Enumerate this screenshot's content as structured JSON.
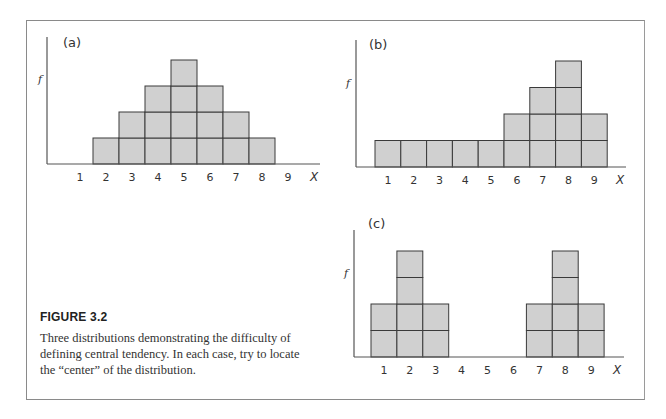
{
  "figure": {
    "title": "FIGURE 3.2",
    "caption": "Three distributions demonstrating the difficulty of defining central tendency. In each case, try to locate the “center” of the distribution."
  },
  "colors": {
    "bar_fill": "#d0d0d0",
    "bar_stroke": "#3a3a3a",
    "axis": "#555555",
    "frame": "#8a8a8a"
  },
  "chart_data": [
    {
      "type": "bar",
      "panel": "(a)",
      "title": "(a)",
      "xlabel": "X",
      "ylabel": "f",
      "categories": [
        "1",
        "2",
        "3",
        "4",
        "5",
        "6",
        "7",
        "8",
        "9"
      ],
      "values": [
        0,
        1,
        2,
        3,
        4,
        3,
        2,
        1,
        0
      ],
      "ylim": [
        0,
        4
      ],
      "grid": false,
      "legend": null,
      "style": "stacked unit blocks (histogram)"
    },
    {
      "type": "bar",
      "panel": "(b)",
      "title": "(b)",
      "xlabel": "X",
      "ylabel": "f",
      "categories": [
        "1",
        "2",
        "3",
        "4",
        "5",
        "6",
        "7",
        "8",
        "9"
      ],
      "values": [
        1,
        1,
        1,
        1,
        1,
        2,
        3,
        4,
        2
      ],
      "ylim": [
        0,
        4
      ],
      "grid": false,
      "legend": null,
      "style": "stacked unit blocks (histogram)"
    },
    {
      "type": "bar",
      "panel": "(c)",
      "title": "(c)",
      "xlabel": "X",
      "ylabel": "f",
      "categories": [
        "1",
        "2",
        "3",
        "4",
        "5",
        "6",
        "7",
        "8",
        "9"
      ],
      "values": [
        2,
        4,
        2,
        0,
        0,
        0,
        2,
        4,
        2
      ],
      "ylim": [
        0,
        4
      ],
      "grid": false,
      "legend": null,
      "style": "stacked unit blocks (histogram)"
    }
  ]
}
